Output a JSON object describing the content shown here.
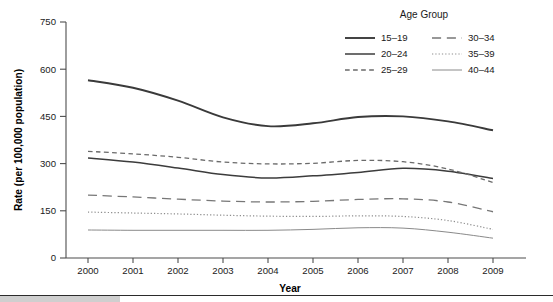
{
  "chart_data": {
    "type": "line",
    "title": "",
    "xlabel": "Year",
    "ylabel": "Rate (per 100,000 population)",
    "x": [
      2000,
      2001,
      2002,
      2003,
      2004,
      2005,
      2006,
      2007,
      2008,
      2009
    ],
    "xtick_labels": [
      "2000",
      "2001",
      "2002",
      "2003",
      "2004",
      "2005",
      "2006",
      "2007",
      "2008",
      "2009"
    ],
    "ytick_labels": [
      "0",
      "150",
      "300",
      "450",
      "600",
      "750"
    ],
    "yticks": [
      0,
      150,
      300,
      450,
      600,
      750
    ],
    "ylim": [
      0,
      750
    ],
    "xlim": [
      2000,
      2009
    ],
    "grid": false,
    "legend_title": "Age Group",
    "legend_position": "top-right",
    "legend_columns": 2,
    "series": [
      {
        "name": "15–19",
        "label": "15–19",
        "style": "solid",
        "width": 1.9,
        "color": "#3a3a3a",
        "values": [
          565,
          541,
          500,
          447,
          419,
          428,
          448,
          450,
          434,
          406
        ]
      },
      {
        "name": "20–24",
        "label": "20–24",
        "style": "solid",
        "width": 1.5,
        "color": "#3c3c3c",
        "values": [
          318,
          305,
          286,
          265,
          254,
          261,
          272,
          285,
          276,
          253
        ]
      },
      {
        "name": "25–29",
        "label": "25–29",
        "style": "dashed",
        "width": 1.3,
        "color": "#6a6a6a",
        "values": [
          339,
          331,
          320,
          305,
          299,
          301,
          310,
          306,
          283,
          240
        ]
      },
      {
        "name": "30–34",
        "label": "30–34",
        "style": "longdash",
        "width": 1.3,
        "color": "#777777",
        "values": [
          200,
          194,
          187,
          181,
          178,
          180,
          186,
          188,
          178,
          147
        ]
      },
      {
        "name": "35–39",
        "label": "35–39",
        "style": "dotted",
        "width": 1.2,
        "color": "#8e8e8e",
        "values": [
          146,
          143,
          140,
          136,
          133,
          132,
          134,
          132,
          119,
          91
        ]
      },
      {
        "name": "40–44",
        "label": "40–44",
        "style": "solid",
        "width": 1.0,
        "color": "#8a8a8a",
        "values": [
          89,
          88,
          88,
          88,
          88,
          91,
          96,
          95,
          82,
          63
        ]
      }
    ]
  },
  "legend": {
    "title": "Age Group",
    "entries": [
      {
        "label": "15–19",
        "style": "solid"
      },
      {
        "label": "30–34",
        "style": "longdash"
      },
      {
        "label": "20–24",
        "style": "solid"
      },
      {
        "label": "35–39",
        "style": "dotted"
      },
      {
        "label": "25–29",
        "style": "dashed"
      },
      {
        "label": "40–44",
        "style": "solid"
      }
    ]
  },
  "axes": {
    "y_title": "Rate (per 100,000 population)",
    "x_title": "Year"
  },
  "colors": {
    "axis": "#4d4d4d",
    "text": "#1a1a1a",
    "footer_block": "#cfcfcf",
    "footer_rule": "#2b2b2b"
  }
}
